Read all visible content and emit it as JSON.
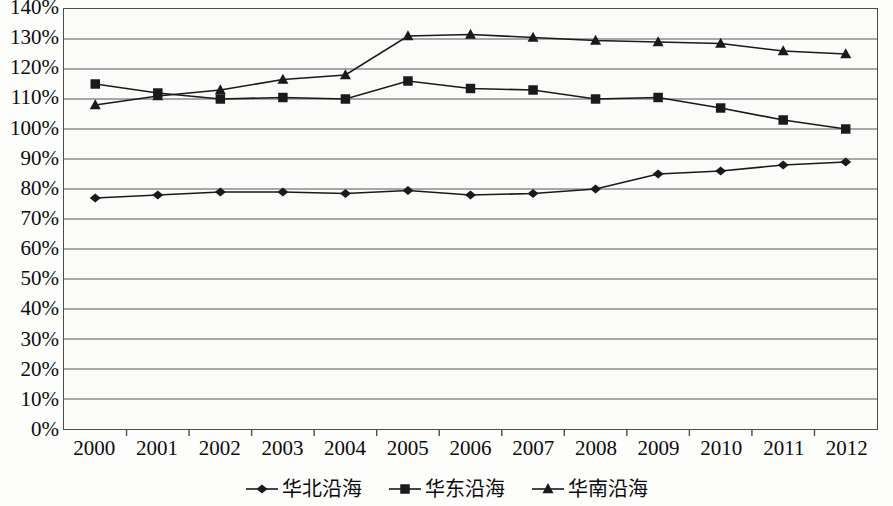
{
  "chart_data": {
    "type": "line",
    "title": "",
    "subtitle": "",
    "xlabel": "",
    "ylabel": "",
    "categories": [
      "2000",
      "2001",
      "2002",
      "2003",
      "2004",
      "2005",
      "2006",
      "2007",
      "2008",
      "2009",
      "2010",
      "2011",
      "2012"
    ],
    "ylim": [
      0,
      140
    ],
    "ytick_step": 10,
    "ytick_labels": [
      "140%",
      "130%",
      "120%",
      "110%",
      "100%",
      "90%",
      "80%",
      "70%",
      "60%",
      "50%",
      "40%",
      "30%",
      "20%",
      "10%",
      "0%"
    ],
    "ytick_values": [
      140,
      130,
      120,
      110,
      100,
      90,
      80,
      70,
      60,
      50,
      40,
      30,
      20,
      10,
      0
    ],
    "grid": true,
    "grid_axis": "y",
    "legend_position": "bottom",
    "value_unit": "%",
    "series": [
      {
        "name": "华北沿海",
        "marker": "diamond",
        "color": "#1a1a1a",
        "values": [
          77,
          78,
          79,
          79,
          78.5,
          79.5,
          78,
          78.5,
          80,
          85,
          86,
          88,
          89
        ]
      },
      {
        "name": "华东沿海",
        "marker": "square",
        "color": "#1a1a1a",
        "values": [
          115,
          112,
          110,
          110.5,
          110,
          116,
          113.5,
          113,
          110,
          110.5,
          107,
          103,
          100
        ]
      },
      {
        "name": "华南沿海",
        "marker": "triangle",
        "color": "#1a1a1a",
        "values": [
          108,
          111,
          113,
          116.5,
          118,
          131,
          131.5,
          130.5,
          129.5,
          129,
          128.5,
          126,
          125
        ]
      }
    ]
  },
  "legend": {
    "entries": [
      {
        "label": "华北沿海",
        "marker": "diamond"
      },
      {
        "label": "华东沿海",
        "marker": "square"
      },
      {
        "label": "华南沿海",
        "marker": "triangle"
      }
    ]
  },
  "colors": {
    "series_line": "#1a1a1a",
    "grid_line": "#8c8c8c",
    "axis_line": "#4d4d4d",
    "plot_background": "#fbfbfa",
    "page_background": "#fdfdfc",
    "text": "#0b0b0b"
  }
}
